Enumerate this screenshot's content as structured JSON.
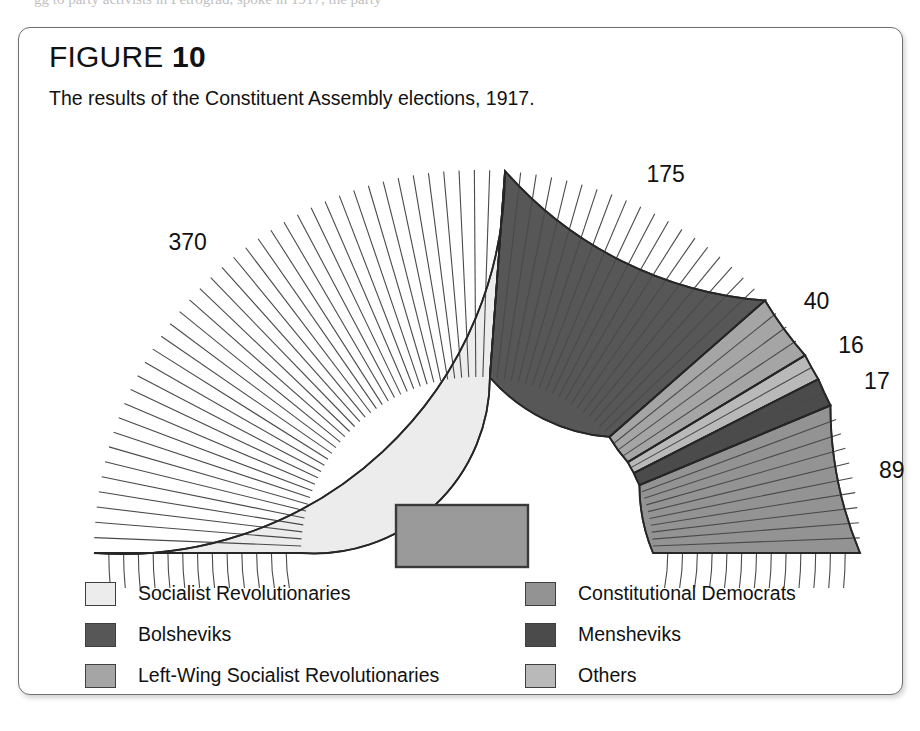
{
  "page_remnant": "gg to party activists in Petrograd, spoke in 1917, the party",
  "figure": {
    "label_word": "FIGURE",
    "number": "10",
    "caption": "The results of the Constituent Assembly elections, 1917."
  },
  "podium": {
    "name": "speaker-podium",
    "fill": "#9a9a9a",
    "stroke": "#3a3a3a"
  },
  "legend": {
    "column_1": [
      {
        "label": "Socialist Revolutionaries",
        "color": "#ececec"
      },
      {
        "label": "Bolsheviks",
        "color": "#575757"
      },
      {
        "label": "Left-Wing Socialist Revolutionaries",
        "color": "#a5a5a5"
      }
    ],
    "column_2": [
      {
        "label": "Constitutional Democrats",
        "color": "#939393"
      },
      {
        "label": "Mensheviks",
        "color": "#4b4b4b"
      },
      {
        "label": "Others",
        "color": "#b9b9b9"
      }
    ]
  },
  "chart_data": {
    "type": "pie",
    "variant": "hemicycle-parliament-diagram",
    "title": "The results of the Constituent Assembly elections, 1917.",
    "units": "seats",
    "total": 707,
    "ring_count": 14,
    "legend_position": "bottom",
    "grid": false,
    "categories": [
      "Socialist Revolutionaries",
      "Bolsheviks",
      "Left-Wing Socialist Revolutionaries",
      "Constitutional Democrats",
      "Mensheviks",
      "Others"
    ],
    "values": [
      370,
      175,
      40,
      16,
      17,
      89
    ],
    "colors": [
      "#ececec",
      "#575757",
      "#a5a5a5",
      "#939393",
      "#4b4b4b",
      "#b9b9b9"
    ],
    "seat_order": [
      {
        "name": "Socialist Revolutionaries",
        "value": 370,
        "color": "#ececec",
        "label": "370"
      },
      {
        "name": "Bolsheviks",
        "value": 175,
        "color": "#575757",
        "label": "175"
      },
      {
        "name": "Left-Wing Socialist Revolutionaries",
        "value": 40,
        "color": "#a5a5a5",
        "label": "40"
      },
      {
        "name": "Others",
        "value": 16,
        "color": "#b9b9b9",
        "label": "16"
      },
      {
        "name": "Mensheviks",
        "value": 17,
        "color": "#4b4b4b",
        "label": "17"
      },
      {
        "name": "Constitutional Democrats",
        "value": 89,
        "color": "#939393",
        "label": "89"
      }
    ],
    "data_labels": [
      "370",
      "175",
      "40",
      "16",
      "17",
      "89"
    ]
  }
}
